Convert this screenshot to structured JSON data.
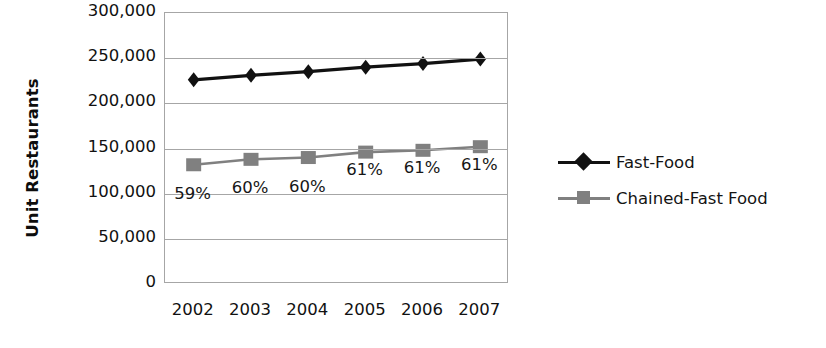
{
  "chart_data": {
    "type": "line",
    "title": "",
    "xlabel": "",
    "ylabel": "Unit Restaurants",
    "categories": [
      "2002",
      "2003",
      "2004",
      "2005",
      "2006",
      "2007"
    ],
    "ylim": [
      0,
      300000
    ],
    "ytick_labels": [
      "300,000",
      "250,000",
      "200,000",
      "150,000",
      "100,000",
      "50,000",
      "0"
    ],
    "ytick_values": [
      300000,
      250000,
      200000,
      150000,
      100000,
      50000,
      0
    ],
    "grid": true,
    "legend_position": "right",
    "series": [
      {
        "name": "Fast-Food",
        "marker": "diamond",
        "color": "#111111",
        "values": [
          226000,
          231000,
          235000,
          240000,
          244000,
          249000
        ],
        "labels": [
          "",
          "",
          "",
          "",
          "",
          ""
        ]
      },
      {
        "name": "Chained-Fast Food",
        "marker": "square",
        "color": "#808080",
        "values": [
          132000,
          138000,
          140000,
          146000,
          148000,
          152000
        ],
        "labels": [
          "59%",
          "60%",
          "60%",
          "61%",
          "61%",
          "61%"
        ]
      }
    ]
  },
  "legend": {
    "items": [
      {
        "label": "Fast-Food",
        "color": "#111111",
        "marker": "diamond"
      },
      {
        "label": "Chained-Fast Food",
        "color": "#808080",
        "marker": "square"
      }
    ]
  }
}
